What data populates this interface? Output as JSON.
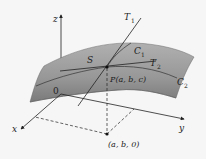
{
  "diagram": {
    "labels": {
      "z_axis": "z",
      "x_axis": "x",
      "y_axis": "y",
      "origin": "0",
      "surface": "S",
      "tangent1": "T",
      "tangent1_sub": "1",
      "tangent2": "T",
      "tangent2_sub": "2",
      "curve1": "C",
      "curve1_sub": "1",
      "curve2": "C",
      "curve2_sub": "2",
      "point": "P(a, b, c)",
      "projection": "(a, b, 0)"
    },
    "colors": {
      "surface_top": "#a8a8a8",
      "surface_bottom": "#7d7d7d",
      "line": "#222222",
      "background": "#f6f6f6"
    }
  }
}
